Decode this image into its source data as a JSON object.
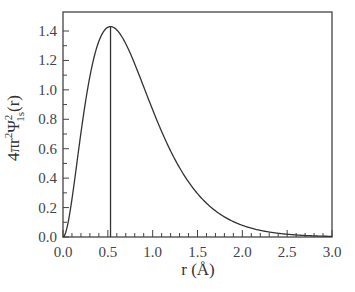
{
  "chart_data": {
    "type": "line",
    "title": "",
    "xlabel": "r (Å)",
    "ylabel": "4πr²Ψ²1s(r)",
    "ylabel_parts": {
      "prefix": "4πr",
      "sup1": "2",
      "psi": "Ψ",
      "sup2": "2",
      "sub": "1s",
      "suffix": "(r)"
    },
    "xlim": [
      0,
      3.0
    ],
    "ylim": [
      0,
      1.5
    ],
    "x_ticks": [
      "0.0",
      "0.5",
      "1.0",
      "1.5",
      "2.0",
      "2.5",
      "3.0"
    ],
    "x_tick_values": [
      0,
      0.5,
      1.0,
      1.5,
      2.0,
      2.5,
      3.0
    ],
    "x_minor_step": 0.1,
    "y_ticks": [
      "0.0",
      "0.2",
      "0.4",
      "0.6",
      "0.8",
      "1.0",
      "1.2",
      "1.4"
    ],
    "y_tick_values": [
      0,
      0.2,
      0.4,
      0.6,
      0.8,
      1.0,
      1.2,
      1.4
    ],
    "grid": false,
    "legend": null,
    "series": [
      {
        "name": "Radial probability density 1s",
        "x": [
          0.0,
          0.1,
          0.2,
          0.3,
          0.4,
          0.5,
          0.53,
          0.6,
          0.7,
          0.8,
          0.9,
          1.0,
          1.2,
          1.4,
          1.6,
          1.8,
          2.0,
          2.2,
          2.4,
          2.6,
          2.8,
          3.0
        ],
        "y": [
          0.0,
          0.1,
          0.34,
          0.69,
          1.05,
          1.32,
          1.43,
          1.41,
          1.34,
          1.22,
          1.08,
          0.93,
          0.66,
          0.44,
          0.28,
          0.17,
          0.1,
          0.06,
          0.03,
          0.02,
          0.01,
          0.005
        ]
      }
    ],
    "annotations": [
      {
        "type": "vertical-line",
        "x": 0.53,
        "label": "Bohr radius (peak)"
      }
    ]
  }
}
